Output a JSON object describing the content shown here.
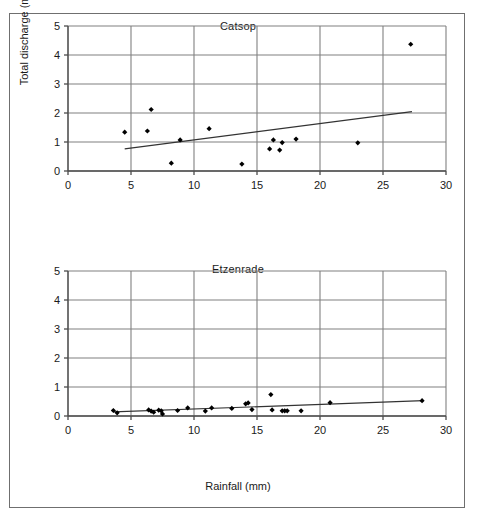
{
  "figure": {
    "xlabel": "Rainfall (mm)",
    "ylabel": "Total discharge (mm)",
    "border_color": "#6f6f6f",
    "grid_color": "#808080",
    "axis_color": "#4d4d4d",
    "marker_color": "#000000",
    "trend_color": "#333333"
  },
  "chart_data": [
    {
      "type": "scatter",
      "title": "Catsop",
      "xlabel": "Rainfall (mm)",
      "ylabel": "Total discharge (mm)",
      "xlim": [
        0,
        30
      ],
      "ylim": [
        0,
        5
      ],
      "xticks": [
        0,
        5,
        10,
        15,
        20,
        25,
        30
      ],
      "yticks": [
        0,
        1,
        2,
        3,
        4,
        5
      ],
      "grid": true,
      "legend": "none",
      "marker": "diamond",
      "points": [
        {
          "x": 4.5,
          "y": 1.34
        },
        {
          "x": 6.3,
          "y": 1.38
        },
        {
          "x": 6.6,
          "y": 2.12
        },
        {
          "x": 8.2,
          "y": 0.27
        },
        {
          "x": 8.9,
          "y": 1.07
        },
        {
          "x": 11.2,
          "y": 1.46
        },
        {
          "x": 13.8,
          "y": 0.24
        },
        {
          "x": 16.0,
          "y": 0.76
        },
        {
          "x": 16.3,
          "y": 1.07
        },
        {
          "x": 16.8,
          "y": 0.72
        },
        {
          "x": 17.0,
          "y": 0.98
        },
        {
          "x": 18.1,
          "y": 1.1
        },
        {
          "x": 23.0,
          "y": 0.97
        },
        {
          "x": 27.2,
          "y": 4.37
        }
      ],
      "trendline": {
        "x0": 4.5,
        "y0": 0.76,
        "x1": 27.3,
        "y1": 2.05
      }
    },
    {
      "type": "scatter",
      "title": "Etzenrade",
      "xlabel": "Rainfall (mm)",
      "ylabel": "Total discharge (mm)",
      "xlim": [
        0,
        30
      ],
      "ylim": [
        0,
        5
      ],
      "xticks": [
        0,
        5,
        10,
        15,
        20,
        25,
        30
      ],
      "yticks": [
        0,
        1,
        2,
        3,
        4,
        5
      ],
      "grid": true,
      "legend": "none",
      "marker": "diamond",
      "points": [
        {
          "x": 3.6,
          "y": 0.19
        },
        {
          "x": 3.9,
          "y": 0.11
        },
        {
          "x": 6.4,
          "y": 0.21
        },
        {
          "x": 6.6,
          "y": 0.17
        },
        {
          "x": 6.8,
          "y": 0.13
        },
        {
          "x": 7.2,
          "y": 0.2
        },
        {
          "x": 7.4,
          "y": 0.18
        },
        {
          "x": 7.5,
          "y": 0.07
        },
        {
          "x": 8.7,
          "y": 0.19
        },
        {
          "x": 9.5,
          "y": 0.28
        },
        {
          "x": 10.9,
          "y": 0.17
        },
        {
          "x": 11.4,
          "y": 0.28
        },
        {
          "x": 13.0,
          "y": 0.26
        },
        {
          "x": 14.1,
          "y": 0.42
        },
        {
          "x": 14.3,
          "y": 0.45
        },
        {
          "x": 14.6,
          "y": 0.22
        },
        {
          "x": 16.1,
          "y": 0.74
        },
        {
          "x": 16.2,
          "y": 0.21
        },
        {
          "x": 17.0,
          "y": 0.18
        },
        {
          "x": 17.2,
          "y": 0.18
        },
        {
          "x": 17.4,
          "y": 0.18
        },
        {
          "x": 18.5,
          "y": 0.18
        },
        {
          "x": 20.8,
          "y": 0.46
        },
        {
          "x": 28.1,
          "y": 0.53
        }
      ],
      "trendline": {
        "x0": 3.6,
        "y0": 0.14,
        "x1": 28.2,
        "y1": 0.53
      }
    }
  ]
}
